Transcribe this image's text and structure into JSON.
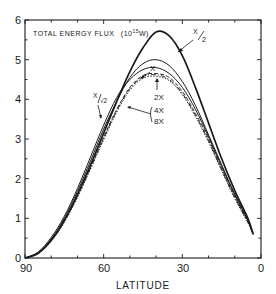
{
  "chart_data": {
    "type": "line",
    "title_main": "TOTAL ENERGY FLUX",
    "title_unit_prefix": "(10",
    "title_unit_exp": "15",
    "title_unit_suffix": "W)",
    "xlabel": "LATITUDE",
    "ylabel": "",
    "xlim": [
      90,
      0
    ],
    "ylim": [
      0,
      6
    ],
    "x_ticks": [
      90,
      60,
      30,
      0
    ],
    "y_ticks": [
      0,
      1,
      2,
      3,
      4,
      5,
      6
    ],
    "grid": false,
    "legend_position": "inline annotations",
    "x": [
      90,
      85,
      80,
      75,
      70,
      65,
      60,
      55,
      50,
      45,
      40,
      35,
      30,
      25,
      20,
      15,
      10,
      5,
      3
    ],
    "series": [
      {
        "name": "X/2",
        "style": "solid-bold",
        "values": [
          0,
          0.12,
          0.45,
          0.95,
          1.6,
          2.35,
          3.15,
          3.95,
          4.7,
          5.3,
          5.7,
          5.6,
          5.1,
          4.3,
          3.4,
          2.5,
          1.7,
          1.0,
          0.6
        ]
      },
      {
        "name": "X",
        "style": "solid",
        "values": [
          0,
          0.13,
          0.48,
          1.0,
          1.68,
          2.45,
          3.25,
          3.95,
          4.55,
          4.9,
          5.0,
          4.85,
          4.45,
          3.85,
          3.1,
          2.35,
          1.6,
          0.95,
          0.6
        ]
      },
      {
        "name": "X/√2",
        "style": "solid",
        "values": [
          0,
          0.15,
          0.52,
          1.05,
          1.75,
          2.55,
          3.35,
          4.05,
          4.5,
          4.75,
          4.8,
          4.65,
          4.3,
          3.75,
          3.05,
          2.3,
          1.6,
          0.95,
          0.6
        ]
      },
      {
        "name": "2X",
        "style": "dashed",
        "values": [
          0,
          0.12,
          0.44,
          0.93,
          1.57,
          2.3,
          3.05,
          3.75,
          4.3,
          4.6,
          4.65,
          4.55,
          4.2,
          3.65,
          3.0,
          2.25,
          1.55,
          0.92,
          0.6
        ]
      },
      {
        "name": "4X",
        "style": "dash-dot",
        "values": [
          0,
          0.12,
          0.43,
          0.92,
          1.55,
          2.27,
          3.02,
          3.72,
          4.27,
          4.57,
          4.62,
          4.5,
          4.15,
          3.6,
          2.95,
          2.22,
          1.52,
          0.9,
          0.6
        ]
      },
      {
        "name": "8X",
        "style": "dotted",
        "values": [
          0,
          0.11,
          0.42,
          0.9,
          1.52,
          2.24,
          2.98,
          3.68,
          4.23,
          4.53,
          4.58,
          4.47,
          4.12,
          3.57,
          2.92,
          2.2,
          1.5,
          0.89,
          0.6
        ]
      }
    ],
    "annotations": [
      {
        "text": "X/2",
        "points_to": "X/2 curve near latitude 30"
      },
      {
        "text": "X",
        "points_to": "X curve near latitude 45"
      },
      {
        "text": "X/√2",
        "points_to": "X/√2 curve near latitude 58"
      },
      {
        "text": "2X",
        "points_to": "dashed curve peak near latitude 40"
      },
      {
        "text": "4X",
        "points_to": "dash-dot curves near latitude 52"
      },
      {
        "text": "8X",
        "points_to": "dash-dot curves near latitude 52"
      }
    ]
  },
  "labels": {
    "y_tick_0": "0",
    "y_tick_1": "1",
    "y_tick_2": "2",
    "y_tick_3": "3",
    "y_tick_4": "4",
    "y_tick_5": "5",
    "y_tick_6": "6",
    "x_tick_90": "90",
    "x_tick_60": "60",
    "x_tick_30": "30",
    "x_tick_0": "0",
    "xlabel": "LATITUDE",
    "ann_x2_num": "X",
    "ann_x2_den": "2",
    "ann_x": "X",
    "ann_xsqrt2_num": "X",
    "ann_xsqrt2_den": "√2",
    "ann_2x": "2X",
    "ann_4x": "4X",
    "ann_8x": "8X"
  }
}
